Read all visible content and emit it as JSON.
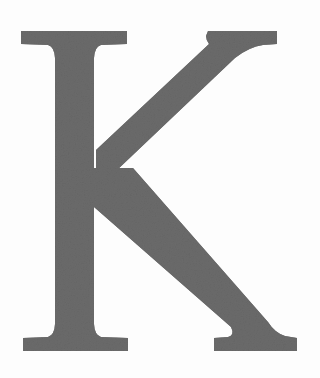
{
  "document": {
    "kind": "scanned-letterform",
    "character": "K",
    "character_case": "uppercase",
    "typeface_style": "serif",
    "description": "Large uppercase serif letter K"
  },
  "canvas": {
    "width": 320,
    "height": 378,
    "background_color": "#fdfdfd",
    "paper_tone": "#ffffff"
  },
  "glyph": {
    "label": "K",
    "fill_color": "#6b6b6b",
    "edge_color": "#636363",
    "texture": "fine-grain-scan",
    "bounds": {
      "left": 21,
      "top": 31,
      "right": 297,
      "bottom": 351,
      "cap_height": 320,
      "advance_width": 276
    },
    "metrics": {
      "stem_left": 53,
      "stem_right": 94,
      "stem_width": 41,
      "top_serif_left": 21,
      "top_serif_right": 127,
      "foot_serif_left": 23,
      "foot_serif_right": 128,
      "arm_terminal_left": 208,
      "arm_terminal_right": 277,
      "leg_foot_right": 297,
      "junction_x": 95,
      "junction_y": 193,
      "baseline_y": 351,
      "cap_line_y": 31
    },
    "strokes": [
      {
        "name": "vertical-stem",
        "type": "vertical",
        "weight": "thick"
      },
      {
        "name": "upper-arm",
        "type": "diagonal",
        "direction": "up-right",
        "weight": "medium"
      },
      {
        "name": "lower-leg",
        "type": "diagonal",
        "direction": "down-right",
        "weight": "thick"
      },
      {
        "name": "top-serif",
        "type": "horizontal-serif"
      },
      {
        "name": "foot-serif",
        "type": "horizontal-serif"
      },
      {
        "name": "arm-terminal-serif",
        "type": "flared-serif"
      },
      {
        "name": "leg-foot-serif",
        "type": "flared-serif"
      }
    ]
  }
}
